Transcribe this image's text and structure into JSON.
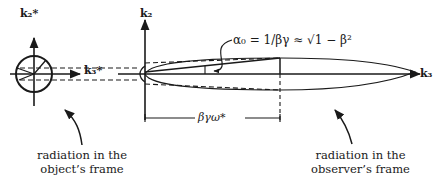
{
  "diagram": {
    "left_frame": {
      "axis_vertical": "k₂*",
      "axis_horizontal": "k₃*",
      "caption_line1": "radiation in the",
      "caption_line2": "object’s frame"
    },
    "right_frame": {
      "axis_vertical": "k₂",
      "axis_horizontal": "k₃",
      "caption_line1": "radiation in the",
      "caption_line2": "observer’s frame"
    },
    "angle_formula": "α₀ = 1/βγ ≈ √1 − β²",
    "length_label": "βγω*",
    "colors": {
      "ink": "#1a1a1a",
      "background": "#ffffff"
    }
  }
}
